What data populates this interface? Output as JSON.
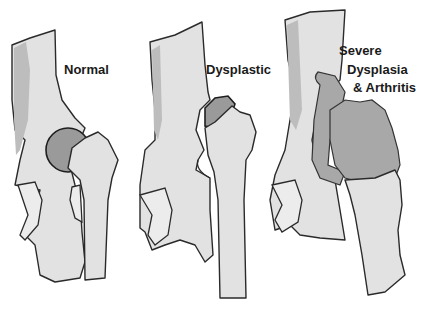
{
  "diagram": {
    "panels": [
      {
        "id": "normal",
        "label": "Normal"
      },
      {
        "id": "dysplastic",
        "label": "Dysplastic"
      },
      {
        "id": "severe",
        "label_lines": [
          "Severe",
          "Dysplasia",
          "& Arthritis"
        ]
      }
    ],
    "colors": {
      "bone": "#e2e2e2",
      "outline": "#2a2a2a",
      "femoral_head": "#9a9a9a",
      "background": "#ffffff"
    }
  }
}
